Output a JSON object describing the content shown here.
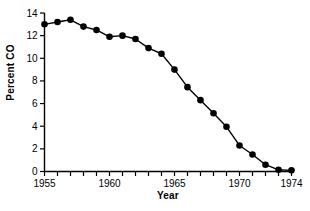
{
  "chart_data": {
    "type": "line",
    "title": "",
    "xlabel": "Year",
    "ylabel": "Percent CO",
    "xlim": [
      1955,
      1974
    ],
    "ylim": [
      0,
      14
    ],
    "ytick_step": 2,
    "xtick_step": 1,
    "grid": false,
    "legend": null,
    "marker": "filled-circle",
    "line_color": "#000000",
    "marker_color": "#000000",
    "x": [
      1955,
      1956,
      1957,
      1958,
      1959,
      1960,
      1961,
      1962,
      1963,
      1964,
      1965,
      1966,
      1967,
      1968,
      1969,
      1970,
      1971,
      1972,
      1973,
      1974
    ],
    "values": [
      13.0,
      13.2,
      13.4,
      12.8,
      12.5,
      11.9,
      12.0,
      11.7,
      10.9,
      10.4,
      9.0,
      7.45,
      6.3,
      5.15,
      3.95,
      2.3,
      1.5,
      0.6,
      0.15,
      0.1
    ],
    "xticklabels": [
      {
        "value": 1955,
        "label": "1955"
      },
      {
        "value": 1960,
        "label": "1960"
      },
      {
        "value": 1965,
        "label": "1965"
      },
      {
        "value": 1970,
        "label": "1970"
      },
      {
        "value": 1974,
        "label": "1974"
      }
    ],
    "yticklabels": [
      {
        "value": 0,
        "label": "0"
      },
      {
        "value": 2,
        "label": "2"
      },
      {
        "value": 4,
        "label": "4"
      },
      {
        "value": 6,
        "label": "6"
      },
      {
        "value": 8,
        "label": "8"
      },
      {
        "value": 10,
        "label": "10"
      },
      {
        "value": 12,
        "label": "12"
      },
      {
        "value": 14,
        "label": "14"
      }
    ]
  },
  "axes": {
    "x_title": "Year",
    "y_title": "Percent CO"
  }
}
